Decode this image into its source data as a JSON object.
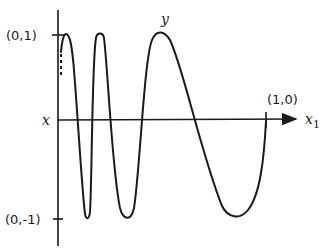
{
  "figure": {
    "type": "oscillating curve diagram (topologist's sine curve style)",
    "labels": {
      "y_top": "(0,1)",
      "y_bottom": "(0,-1)",
      "x_end": "(1,0)",
      "x_left": "x",
      "x_axis": "x",
      "x_axis_subscript": "1",
      "curve": "y"
    },
    "colors": {
      "ink": "#1a1a1a",
      "background": "#ffffff"
    },
    "curve_description": "Continuous curve oscillating between y=1 and y=-1 with oscillations compressing toward x=0; dashed segment near the y-axis indicates infinitely many oscillations; curve ends at (1,0)."
  }
}
